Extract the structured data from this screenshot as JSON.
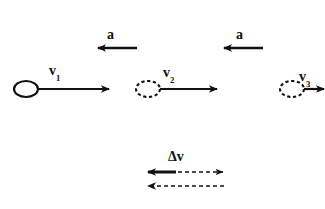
{
  "figure": {
    "type": "physics-kinematics-vector-diagram",
    "background_color": "#ffffff",
    "stroke_color": "#111111",
    "width": 325,
    "height": 209
  },
  "labels": {
    "v1": "v",
    "v1_sub": "1",
    "v2": "v",
    "v2_sub": "2",
    "v3": "v",
    "v3_sub": "3",
    "a_left": "a",
    "a_right": "a",
    "delta_v": "Δv"
  },
  "objects": [
    {
      "name": "ball-position-1",
      "style": "solid",
      "cx": 26,
      "cy": 89,
      "rx": 12,
      "ry": 8
    },
    {
      "name": "ball-position-2",
      "style": "dashed",
      "cx": 148,
      "cy": 89,
      "rx": 12,
      "ry": 8
    },
    {
      "name": "ball-position-3",
      "style": "dashed",
      "cx": 292,
      "cy": 89,
      "rx": 12,
      "ry": 8
    }
  ],
  "velocity_vectors": [
    {
      "name": "v1",
      "label": "v1",
      "x1": 38,
      "x2": 110,
      "y": 89,
      "direction": "right",
      "length": 72
    },
    {
      "name": "v2",
      "label": "v2",
      "x1": 160,
      "x2": 218,
      "y": 89,
      "direction": "right",
      "length": 58
    },
    {
      "name": "v3",
      "label": "v3",
      "x1": 304,
      "x2": 325,
      "y": 89,
      "direction": "right",
      "length": 21
    }
  ],
  "acceleration_vectors": [
    {
      "name": "a-left",
      "label": "a_left",
      "x1": 137,
      "x2": 97,
      "y": 48,
      "direction": "left",
      "length": 40
    },
    {
      "name": "a-right",
      "label": "a_right",
      "x1": 263,
      "x2": 223,
      "y": 48,
      "direction": "left",
      "length": 40
    }
  ],
  "delta_v_construction": {
    "label": "delta_v",
    "rows": [
      {
        "name": "delta-v-top-row",
        "y": 172,
        "solid_arrow": {
          "x_tip": 147,
          "x_tail": 175,
          "direction": "left",
          "style": "solid"
        },
        "dashed_arrow": {
          "x_tail": 150,
          "x_tip": 224,
          "direction": "right",
          "style": "dashed"
        }
      },
      {
        "name": "delta-v-bottom-row",
        "y": 186,
        "dashed_arrow": {
          "x_tip": 147,
          "x_tail": 224,
          "direction": "left",
          "style": "dashed"
        }
      }
    ]
  }
}
